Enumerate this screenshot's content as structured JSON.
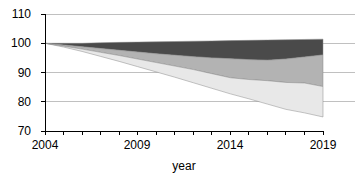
{
  "chart_data": {
    "type": "area",
    "title": "",
    "subtitle": "",
    "xlabel": "year",
    "ylabel": "",
    "stacked": true,
    "grid": true,
    "legend": "none",
    "xlim": [
      2004,
      2019
    ],
    "ylim": [
      70,
      110
    ],
    "ytick_values": [
      110,
      100,
      90,
      80,
      70
    ],
    "ytick_labels": [
      "110",
      "100",
      "90",
      "80",
      "70"
    ],
    "xtick_values": [
      2004,
      2009,
      2014,
      2019
    ],
    "xtick_labels": [
      "2004",
      "2009",
      "2014",
      "2019"
    ],
    "xtick_minor_step": 1,
    "x": [
      2004,
      2005,
      2006,
      2007,
      2008,
      2009,
      2010,
      2011,
      2012,
      2013,
      2014,
      2015,
      2016,
      2017,
      2018,
      2019
    ],
    "band_boundaries": {
      "top": [
        100.0,
        100.0,
        100.0,
        100.2,
        100.3,
        100.4,
        100.5,
        100.6,
        100.7,
        100.8,
        100.9,
        101.0,
        101.1,
        101.2,
        101.3,
        101.4
      ],
      "upper_mid": [
        100.0,
        99.4,
        98.8,
        98.2,
        97.6,
        97.0,
        96.4,
        95.9,
        95.4,
        95.0,
        94.7,
        94.4,
        94.2,
        94.6,
        95.3,
        96.0
      ],
      "lower_mid": [
        100.0,
        99.0,
        98.0,
        96.9,
        95.8,
        94.6,
        93.4,
        92.2,
        91.0,
        89.6,
        88.2,
        87.6,
        87.2,
        86.6,
        86.4,
        85.2
      ],
      "bottom": [
        100.0,
        98.7,
        97.2,
        95.5,
        93.8,
        92.0,
        90.2,
        88.4,
        86.5,
        84.6,
        82.7,
        81.0,
        79.2,
        77.4,
        76.2,
        74.8
      ]
    },
    "series": [
      {
        "name": "top-band",
        "color": "#4a4a4a",
        "description": "dark gray upper band between upper_mid and top"
      },
      {
        "name": "middle-band",
        "color": "#b3b3b3",
        "description": "medium gray band between lower_mid and upper_mid"
      },
      {
        "name": "bottom-band",
        "color": "#e8e8e8",
        "description": "light gray band between bottom and lower_mid"
      }
    ],
    "colors": {
      "top_band": "#4a4a4a",
      "middle_band": "#b3b3b3",
      "bottom_band": "#e8e8e8",
      "axis": "#000000",
      "gridline": "#b0b0b0",
      "background": "#ffffff"
    }
  },
  "axes": {
    "y_ticks": [
      {
        "label": "110",
        "value": 110
      },
      {
        "label": "100",
        "value": 100
      },
      {
        "label": "90",
        "value": 90
      },
      {
        "label": "80",
        "value": 80
      },
      {
        "label": "70",
        "value": 70
      }
    ],
    "x_ticks": [
      {
        "label": "2004",
        "value": 2004
      },
      {
        "label": "2009",
        "value": 2009
      },
      {
        "label": "2014",
        "value": 2014
      },
      {
        "label": "2019",
        "value": 2019
      }
    ],
    "x_axis_title": "year"
  }
}
